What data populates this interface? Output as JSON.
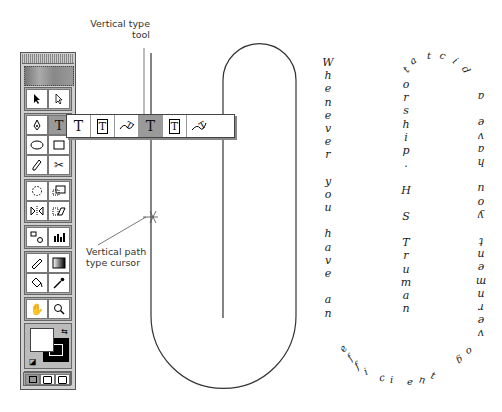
{
  "callouts": {
    "vertical_type_tool": "Vertical type tool",
    "vertical_path_cursor": "Vertical path type cursor"
  },
  "toolbox": {
    "rows": [
      [
        "selection-arrow",
        "direct-selection-arrow"
      ],
      [
        "pen",
        "type"
      ],
      [
        "ellipse",
        "rectangle"
      ],
      [
        "pencil",
        "scissors"
      ],
      [
        "rotate",
        "scale"
      ],
      [
        "reflect",
        "shear"
      ],
      [
        "blend",
        "graph"
      ],
      [
        "measure",
        "gradient"
      ],
      [
        "paint-bucket",
        "eyedropper"
      ],
      [
        "hand",
        "zoom"
      ]
    ],
    "type_glyph": "T",
    "fill_color": "#ffffff",
    "stroke_color": "#000000",
    "paint_modes": [
      "color",
      "gradient",
      "none"
    ],
    "screen_modes": [
      "standard",
      "full-menu",
      "full"
    ]
  },
  "flyout": {
    "tools": [
      {
        "name": "type",
        "glyph": "T",
        "active": false
      },
      {
        "name": "area-type",
        "glyph": "T",
        "active": false
      },
      {
        "name": "path-type",
        "glyph": "⌄",
        "active": false
      },
      {
        "name": "vertical-type",
        "glyph": "T",
        "active": true
      },
      {
        "name": "vertical-area-type",
        "glyph": "T",
        "active": false
      },
      {
        "name": "vertical-path-type",
        "glyph": "⌄",
        "active": false
      }
    ]
  },
  "text_columns": {
    "left": "Whenever you have an",
    "middle": "orship. H S Truman",
    "right_upside_down": "government you have a",
    "top_arc": "dictat",
    "bottom_arc": "efficient"
  },
  "quote_full": "Whenever you have an efficient government you have a dictatorship. H S Truman"
}
